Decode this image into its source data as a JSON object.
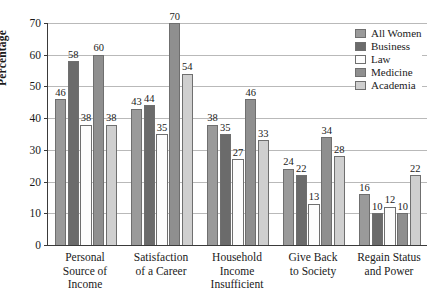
{
  "chart_data": {
    "type": "bar",
    "title": "",
    "xlabel": "",
    "ylabel": "Percentage",
    "ylim": [
      0,
      70
    ],
    "ytick_values": [
      70,
      60,
      50,
      40,
      30,
      20,
      10,
      0
    ],
    "grid": true,
    "legend_position": "top-right",
    "categories": [
      "Personal\nSource of\nIncome",
      "Satisfaction\nof a Career",
      "Household\nIncome\nInsufficient",
      "Give Back\nto Society",
      "Regain Status\nand Power"
    ],
    "category_lines": [
      [
        "Personal",
        "Source of",
        "Income"
      ],
      [
        "Satisfaction",
        "of a Career"
      ],
      [
        "Household",
        "Income",
        "Insufficient"
      ],
      [
        "Give Back",
        "to Society"
      ],
      [
        "Regain Status",
        "and Power"
      ]
    ],
    "series": [
      {
        "name": "All Women",
        "color": "#9a9a9a",
        "values": [
          46,
          43,
          38,
          24,
          16
        ]
      },
      {
        "name": "Business",
        "color": "#6b6b6b",
        "values": [
          58,
          44,
          35,
          22,
          10
        ]
      },
      {
        "name": "Law",
        "color": "#fdfdfd",
        "values": [
          38,
          35,
          27,
          13,
          12
        ]
      },
      {
        "name": "Medicine",
        "color": "#8f8f8f",
        "values": [
          60,
          70,
          46,
          34,
          10
        ]
      },
      {
        "name": "Academia",
        "color": "#cfcfcf",
        "values": [
          38,
          54,
          33,
          28,
          22
        ]
      }
    ]
  },
  "axis": {
    "y_title": "Percentage"
  }
}
